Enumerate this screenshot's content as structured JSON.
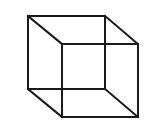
{
  "figure": {
    "type": "necker-cube",
    "stroke_color": "#1a1a1a",
    "background_color": "#ffffff",
    "stroke_width": 2,
    "vertices": {
      "back_top_left": [
        28,
        16
      ],
      "back_top_right": [
        105,
        16
      ],
      "back_bottom_left": [
        28,
        89
      ],
      "back_bottom_right": [
        105,
        89
      ],
      "front_top_left": [
        62,
        44
      ],
      "front_top_right": [
        138,
        44
      ],
      "front_bottom_left": [
        62,
        117
      ],
      "front_bottom_right": [
        138,
        117
      ]
    },
    "edges": [
      [
        "back_top_left",
        "back_top_right"
      ],
      [
        "back_top_right",
        "back_bottom_right"
      ],
      [
        "back_bottom_right",
        "back_bottom_left"
      ],
      [
        "back_bottom_left",
        "back_top_left"
      ],
      [
        "front_top_left",
        "front_top_right"
      ],
      [
        "front_top_right",
        "front_bottom_right"
      ],
      [
        "front_bottom_right",
        "front_bottom_left"
      ],
      [
        "front_bottom_left",
        "front_top_left"
      ],
      [
        "back_top_left",
        "front_top_left"
      ],
      [
        "back_top_right",
        "front_top_right"
      ],
      [
        "back_bottom_left",
        "front_bottom_left"
      ],
      [
        "back_bottom_right",
        "front_bottom_right"
      ]
    ]
  }
}
